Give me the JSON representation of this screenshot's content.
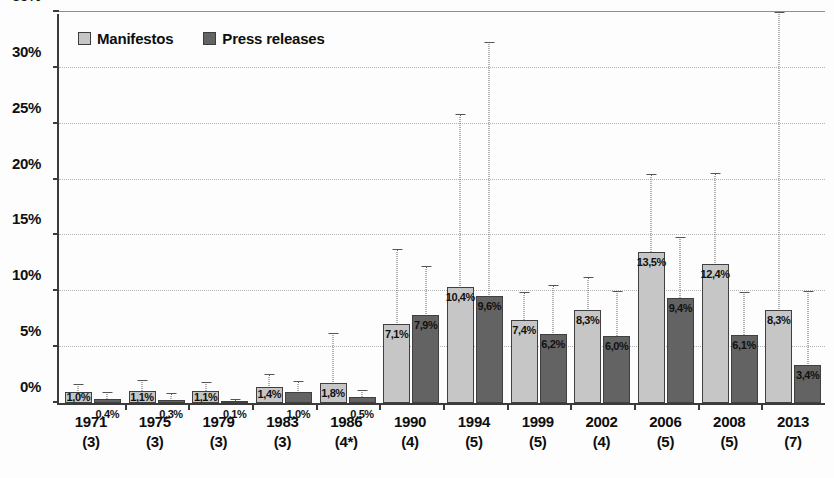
{
  "chart_data": {
    "type": "bar",
    "title": "",
    "subtitle": "",
    "xlabel": "",
    "ylabel": "",
    "ylim": [
      0,
      35
    ],
    "ytick_labels": [
      "0%",
      "5%",
      "10%",
      "15%",
      "20%",
      "25%",
      "30%",
      "35%"
    ],
    "ytick_values": [
      0,
      5,
      10,
      15,
      20,
      25,
      30,
      35
    ],
    "grid": true,
    "grid_axis": "y",
    "legend_position": "top-left",
    "value_label_format": "0,0%",
    "categories": [
      "1971",
      "1975",
      "1979",
      "1983",
      "1986",
      "1990",
      "1994",
      "1999",
      "2002",
      "2006",
      "2008",
      "2013"
    ],
    "category_sub_labels": [
      "(3)",
      "(3)",
      "(3)",
      "(3)",
      "(4*)",
      "(4)",
      "(5)",
      "(5)",
      "(4)",
      "(5)",
      "(5)",
      "(7)"
    ],
    "series": [
      {
        "name": "Manifestos",
        "color": "#c6c6c6",
        "values": [
          1.0,
          1.1,
          1.1,
          1.4,
          1.8,
          7.1,
          10.4,
          7.4,
          8.3,
          13.5,
          12.4,
          8.3
        ],
        "value_labels": [
          "1,0%",
          "1,1%",
          "1,1%",
          "1,4%",
          "1,8%",
          "7,1%",
          "10,4%",
          "7,4%",
          "8,3%",
          "13,5%",
          "12,4%",
          "8,3%"
        ],
        "error_upper": [
          1.7,
          2.1,
          1.9,
          2.6,
          6.3,
          13.8,
          25.9,
          9.9,
          11.3,
          20.5,
          20.6,
          35.0
        ]
      },
      {
        "name": "Press releases",
        "color": "#636363",
        "values": [
          0.4,
          0.3,
          0.1,
          1.0,
          0.5,
          7.9,
          9.6,
          6.2,
          6.0,
          9.4,
          6.1,
          3.4
        ],
        "value_labels": [
          "0,4%",
          "0,3%",
          "0,1%",
          "1,0%",
          "0,5%",
          "7,9%",
          "9,6%",
          "6,2%",
          "6,0%",
          "9,4%",
          "6,1%",
          "3,4%"
        ],
        "error_upper": [
          1.0,
          0.9,
          0.4,
          2.0,
          1.2,
          12.3,
          32.3,
          10.6,
          10.0,
          14.9,
          9.9,
          10.0
        ]
      }
    ]
  },
  "legend": {
    "entries": [
      {
        "label": "Manifestos",
        "swatch": "manifestos"
      },
      {
        "label": "Press releases",
        "swatch": "press"
      }
    ]
  }
}
